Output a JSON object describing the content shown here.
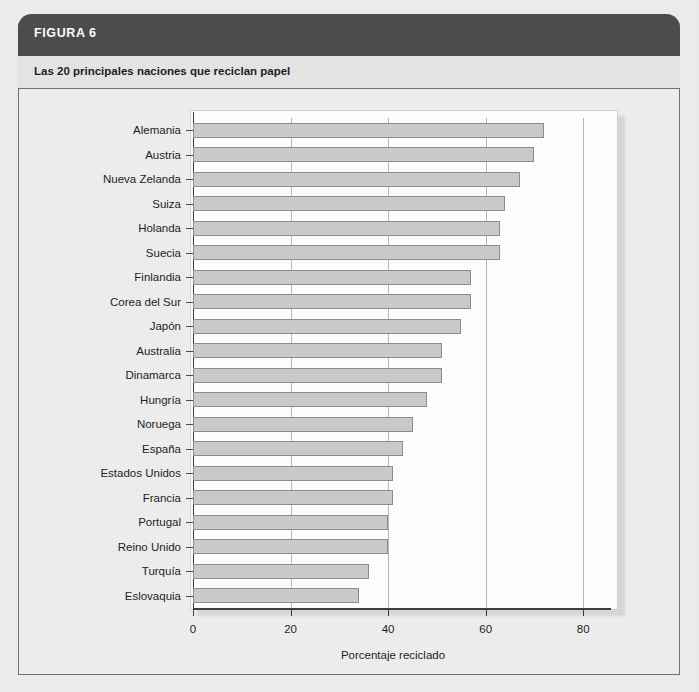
{
  "figure": {
    "header_label": "FIGURA 6",
    "subtitle": "Las 20 principales naciones que reciclan papel",
    "header_color": "#4b4b4b",
    "bar_fill": "#cbcbcb",
    "bar_stroke": "#8d8d8d"
  },
  "chart_data": {
    "type": "bar",
    "orientation": "horizontal",
    "title": "Las 20 principales naciones que reciclan papel",
    "xlabel": "Porcentaje reciclado",
    "ylabel": "",
    "xlim": [
      0,
      82
    ],
    "xticks": [
      0,
      20,
      40,
      60,
      80
    ],
    "xtick_labels": [
      "0",
      "20",
      "40",
      "60",
      "80"
    ],
    "grid": "vertical",
    "legend": "none",
    "categories": [
      "Alemania",
      "Austria",
      "Nueva Zelanda",
      "Suiza",
      "Holanda",
      "Suecia",
      "Finlandia",
      "Corea del Sur",
      "Japón",
      "Australia",
      "Dinamarca",
      "Hungría",
      "Noruega",
      "España",
      "Estados Unidos",
      "Francia",
      "Portugal",
      "Reino Unido",
      "Turquía",
      "Eslovaquia"
    ],
    "values": [
      72,
      70,
      67,
      64,
      63,
      63,
      57,
      57,
      55,
      51,
      51,
      48,
      45,
      43,
      41,
      41,
      40,
      40,
      36,
      34
    ]
  }
}
